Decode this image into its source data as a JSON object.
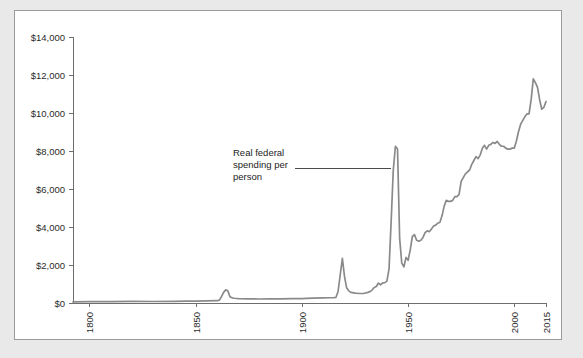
{
  "panel": {
    "background_color": "#ffffff",
    "border_color": "#9a9a9a",
    "page_background_color": "#e9e9e9"
  },
  "chart_data": {
    "type": "line",
    "title": "",
    "subtitle": "",
    "xlabel": "",
    "ylabel": "",
    "grid": false,
    "legend_position": "none",
    "line_color": "#8a8a8a",
    "axis_color": "#6e6e6e",
    "xlim": [
      1792,
      2015
    ],
    "ylim": [
      0,
      14000
    ],
    "y_ticks": [
      0,
      2000,
      4000,
      6000,
      8000,
      10000,
      12000,
      14000
    ],
    "y_tick_labels": [
      "$0",
      "$2,000",
      "$4,000",
      "$6,000",
      "$8,000",
      "$10,000",
      "$12,000",
      "$14,000"
    ],
    "x_ticks": [
      1800,
      1850,
      1900,
      1950,
      2000,
      2015
    ],
    "x_tick_labels": [
      "1800",
      "1850",
      "1900",
      "1950",
      "2000",
      "2015"
    ],
    "annotations": [
      {
        "text_lines": [
          "Real federal",
          "spending per",
          "person"
        ],
        "text": "Real federal spending per person",
        "points_to_year": 1943,
        "points_to_value": 7100
      }
    ],
    "series": [
      {
        "name": "Real federal spending per person",
        "x": [
          1792,
          1800,
          1810,
          1820,
          1830,
          1840,
          1845,
          1850,
          1855,
          1860,
          1861,
          1862,
          1863,
          1864,
          1865,
          1866,
          1867,
          1868,
          1870,
          1875,
          1880,
          1885,
          1890,
          1895,
          1900,
          1902,
          1905,
          1910,
          1913,
          1915,
          1916,
          1917,
          1918,
          1919,
          1920,
          1921,
          1922,
          1923,
          1925,
          1927,
          1929,
          1931,
          1932,
          1933,
          1934,
          1935,
          1936,
          1937,
          1938,
          1939,
          1940,
          1941,
          1942,
          1943,
          1944,
          1945,
          1946,
          1947,
          1948,
          1949,
          1950,
          1951,
          1952,
          1953,
          1954,
          1955,
          1956,
          1957,
          1958,
          1959,
          1960,
          1961,
          1962,
          1963,
          1964,
          1965,
          1966,
          1967,
          1968,
          1969,
          1970,
          1971,
          1972,
          1973,
          1974,
          1975,
          1976,
          1977,
          1978,
          1979,
          1980,
          1981,
          1982,
          1983,
          1984,
          1985,
          1986,
          1987,
          1988,
          1989,
          1990,
          1991,
          1992,
          1993,
          1994,
          1995,
          1996,
          1997,
          1998,
          1999,
          2000,
          2001,
          2002,
          2003,
          2004,
          2005,
          2006,
          2007,
          2008,
          2009,
          2010,
          2011,
          2012,
          2013,
          2014,
          2015
        ],
        "values": [
          60,
          70,
          75,
          85,
          80,
          90,
          95,
          100,
          110,
          120,
          150,
          330,
          560,
          690,
          640,
          330,
          270,
          250,
          230,
          220,
          210,
          215,
          220,
          230,
          235,
          245,
          255,
          265,
          275,
          280,
          300,
          620,
          1500,
          2350,
          1400,
          800,
          640,
          560,
          520,
          500,
          500,
          560,
          600,
          680,
          820,
          870,
          1050,
          960,
          1060,
          1070,
          1150,
          1800,
          4300,
          7000,
          8250,
          8100,
          3400,
          2100,
          1900,
          2400,
          2250,
          2800,
          3500,
          3600,
          3300,
          3250,
          3300,
          3450,
          3700,
          3800,
          3750,
          3900,
          4050,
          4100,
          4200,
          4250,
          4600,
          5100,
          5400,
          5350,
          5350,
          5400,
          5600,
          5600,
          5700,
          6400,
          6600,
          6800,
          6900,
          7000,
          7300,
          7500,
          7700,
          7600,
          7800,
          8150,
          8300,
          8100,
          8300,
          8350,
          8450,
          8400,
          8500,
          8350,
          8250,
          8250,
          8150,
          8100,
          8100,
          8150,
          8150,
          8500,
          9000,
          9400,
          9600,
          9800,
          9950,
          9950,
          10700,
          11800,
          11600,
          11350,
          10700,
          10200,
          10300,
          10600
        ]
      }
    ]
  }
}
